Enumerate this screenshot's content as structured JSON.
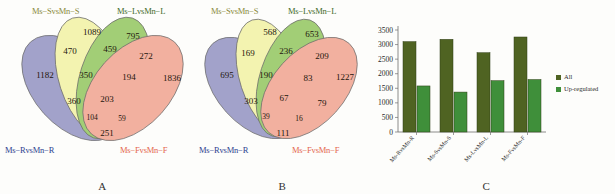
{
  "figure": {
    "panels": [
      {
        "letter": "A"
      },
      {
        "letter": "B"
      },
      {
        "letter": "C"
      }
    ]
  },
  "sets": {
    "s": "Ms−SvsMn−S",
    "l": "Ms−LvsMn−L",
    "r": "Ms−RvsMn−R",
    "f": "Ms−FvsMn−F"
  },
  "colors": {
    "set_r": "#8f8fc0",
    "set_s": "#f2f2a0",
    "set_l": "#8fc45a",
    "set_f": "#f0a08c",
    "label_s": "#8a8a3c",
    "label_l": "#3f6b28",
    "label_r": "#2d3f8f",
    "label_f": "#e4674f",
    "bar_all": "#4f6322",
    "bar_up": "#3f8f3a"
  },
  "venn_a": {
    "title": "A",
    "labels": {
      "top_left": "Ms−SvsMn−S",
      "top_right": "Ms−LvsMn−L",
      "bottom_left": "Ms−RvsMn−R",
      "bottom_right": "Ms−FvsMn−F"
    },
    "regions": [
      {
        "id": "S",
        "value": "1089"
      },
      {
        "id": "L",
        "value": "795"
      },
      {
        "id": "R",
        "value": "1182"
      },
      {
        "id": "F",
        "value": "1836"
      },
      {
        "id": "RS",
        "value": "470"
      },
      {
        "id": "SL",
        "value": "459"
      },
      {
        "id": "LF",
        "value": "272"
      },
      {
        "id": "RSL",
        "value": "350"
      },
      {
        "id": "SLF",
        "value": "194"
      },
      {
        "id": "RL",
        "value": "360"
      },
      {
        "id": "RSLF",
        "value": "203"
      },
      {
        "id": "RLF",
        "value": "104"
      },
      {
        "id": "RSF",
        "value": "59"
      },
      {
        "id": "RF",
        "value": "251"
      }
    ]
  },
  "venn_b": {
    "title": "B",
    "labels": {
      "top_left": "Ms−SvsMn−S",
      "top_right": "Ms−LvsMn−L",
      "bottom_left": "Ms−RvsMn−R",
      "bottom_right": "Ms−FvsMn−F"
    },
    "regions": [
      {
        "id": "S",
        "value": "568"
      },
      {
        "id": "L",
        "value": "653"
      },
      {
        "id": "R",
        "value": "695"
      },
      {
        "id": "F",
        "value": "1227"
      },
      {
        "id": "RS",
        "value": "169"
      },
      {
        "id": "SL",
        "value": "236"
      },
      {
        "id": "LF",
        "value": "209"
      },
      {
        "id": "RSL",
        "value": "190"
      },
      {
        "id": "SLF",
        "value": "83"
      },
      {
        "id": "RL",
        "value": "303"
      },
      {
        "id": "RSLF",
        "value": "67"
      },
      {
        "id": "RLF",
        "value": "39"
      },
      {
        "id": "RSF",
        "value": "16"
      },
      {
        "id": "RF",
        "value": "111"
      },
      {
        "id": "LFx",
        "value": "79"
      }
    ]
  },
  "chart_data": {
    "type": "bar",
    "title": "C",
    "categories": [
      "Ms-RvsMn-R",
      "Ms-SvsMn-S",
      "Ms-LvsMn-L",
      "Ms-FvsMn-F"
    ],
    "series": [
      {
        "name": "All",
        "values": [
          3100,
          3180,
          2720,
          3260
        ],
        "color": "#4f6322"
      },
      {
        "name": "Up-regulated",
        "values": [
          1580,
          1370,
          1760,
          1800
        ],
        "color": "#3f8f3a"
      }
    ],
    "xlabel": "",
    "ylabel": "",
    "ylim": [
      0,
      3500
    ],
    "yticks": [
      0,
      500,
      1000,
      1500,
      2000,
      2500,
      3000,
      3500
    ],
    "ytick_labels": [
      "0",
      "500",
      "1000",
      "1500",
      "2000",
      "2500",
      "3000",
      "3500"
    ],
    "grid": false,
    "legend_position": "right"
  }
}
